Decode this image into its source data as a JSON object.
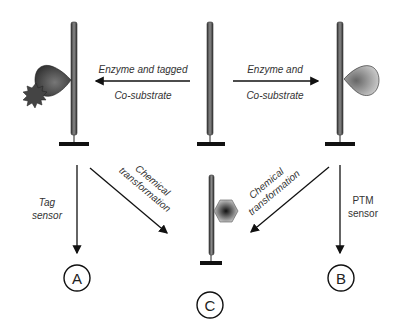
{
  "diagram": {
    "top_left_arrow": {
      "line1": "Enzyme and tagged",
      "line2": "Co-substrate"
    },
    "top_right_arrow": {
      "line1": "Enzyme and",
      "line2": "Co-substrate"
    },
    "left_down_arrow": {
      "line1": "Tag",
      "line2": "sensor"
    },
    "right_down_arrow": {
      "line1": "PTM",
      "line2": "sensor"
    },
    "left_diag_arrow": {
      "line1": "Chemical",
      "line2": "transformation"
    },
    "right_diag_arrow": {
      "line1": "Chemical",
      "line2": "transformation"
    },
    "nodes": {
      "a": "A",
      "b": "B",
      "c": "C"
    },
    "colors": {
      "rod": "#555555",
      "shape_dark": "#333333",
      "shape_light": "#bbbbbb",
      "line": "#111111"
    }
  }
}
